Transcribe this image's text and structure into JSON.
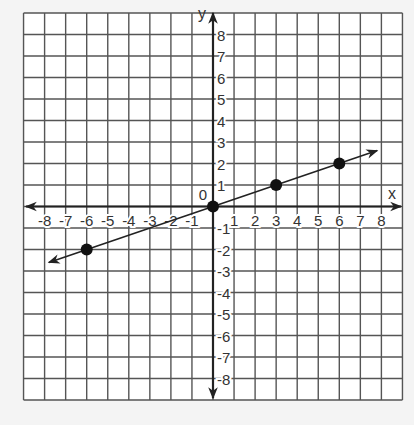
{
  "chart_data": {
    "type": "line",
    "title": "",
    "xlabel": "x",
    "ylabel": "y",
    "xlim": [
      -9,
      9
    ],
    "ylim": [
      -9,
      9
    ],
    "grid": true,
    "origin_label": "0",
    "x_ticks": [
      -8,
      -7,
      -6,
      -5,
      -4,
      -3,
      -2,
      -1,
      1,
      2,
      3,
      4,
      5,
      6,
      7,
      8
    ],
    "y_ticks": [
      8,
      7,
      6,
      5,
      4,
      3,
      2,
      1,
      -1,
      -2,
      -3,
      -4,
      -5,
      -6,
      -7,
      -8
    ],
    "series": [
      {
        "name": "line y = x/3",
        "kind": "line-with-arrows",
        "x": [
          -7.8,
          7.8
        ],
        "y": [
          -2.6,
          2.6
        ]
      },
      {
        "name": "points",
        "kind": "scatter",
        "x": [
          -6,
          0,
          3,
          6
        ],
        "y": [
          -2,
          0,
          1,
          2
        ]
      }
    ]
  }
}
